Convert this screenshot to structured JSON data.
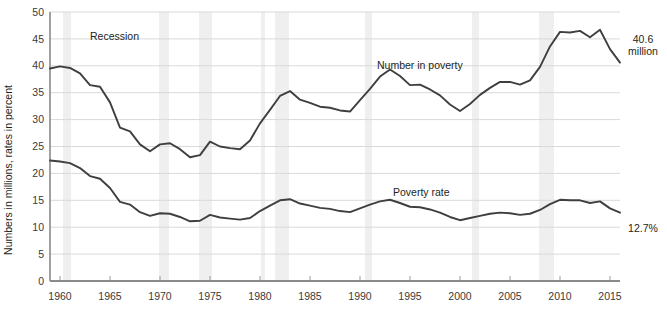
{
  "chart_data": {
    "type": "line",
    "title": "",
    "subtitle": "",
    "xlabel": "",
    "ylabel": "Numbers in millions, rates in percent",
    "xlim": [
      1959,
      2016
    ],
    "ylim": [
      0,
      50
    ],
    "grid": true,
    "legend_position": "inline-annotations",
    "yticks": [
      0,
      5,
      10,
      15,
      20,
      25,
      30,
      35,
      40,
      45,
      50
    ],
    "xticks": [
      1960,
      1965,
      1970,
      1975,
      1980,
      1985,
      1990,
      1995,
      2000,
      2005,
      2010,
      2015
    ],
    "x": [
      1959,
      1960,
      1961,
      1962,
      1963,
      1964,
      1965,
      1966,
      1967,
      1968,
      1969,
      1970,
      1971,
      1972,
      1973,
      1974,
      1975,
      1976,
      1977,
      1978,
      1979,
      1980,
      1981,
      1982,
      1983,
      1984,
      1985,
      1986,
      1987,
      1988,
      1989,
      1990,
      1991,
      1992,
      1993,
      1994,
      1995,
      1996,
      1997,
      1998,
      1999,
      2000,
      2001,
      2002,
      2003,
      2004,
      2005,
      2006,
      2007,
      2008,
      2009,
      2010,
      2011,
      2012,
      2013,
      2014,
      2015,
      2016
    ],
    "series": [
      {
        "name": "Number in poverty",
        "units": "millions",
        "annotation": "Number in poverty",
        "end_label": "40.6\nmillion",
        "end_label_line1": "40.6",
        "end_label_line2": "million",
        "values": [
          39.5,
          39.9,
          39.6,
          38.6,
          36.4,
          36.1,
          33.2,
          28.5,
          27.8,
          25.4,
          24.1,
          25.4,
          25.6,
          24.5,
          23.0,
          23.4,
          25.9,
          25.0,
          24.7,
          24.5,
          26.1,
          29.3,
          31.8,
          34.4,
          35.3,
          33.7,
          33.1,
          32.4,
          32.2,
          31.7,
          31.5,
          33.6,
          35.7,
          38.0,
          39.3,
          38.1,
          36.4,
          36.5,
          35.6,
          34.5,
          32.8,
          31.6,
          32.9,
          34.6,
          35.9,
          37.0,
          37.0,
          36.5,
          37.3,
          39.8,
          43.6,
          46.3,
          46.2,
          46.5,
          45.3,
          46.7,
          43.1,
          40.6
        ]
      },
      {
        "name": "Poverty rate",
        "units": "percent",
        "annotation": "Poverty rate",
        "end_label": "12.7%",
        "end_label_line1": "12.7%",
        "values": [
          22.4,
          22.2,
          21.9,
          21.0,
          19.5,
          19.0,
          17.3,
          14.7,
          14.2,
          12.8,
          12.1,
          12.6,
          12.5,
          11.9,
          11.1,
          11.2,
          12.3,
          11.8,
          11.6,
          11.4,
          11.7,
          13.0,
          14.0,
          15.0,
          15.2,
          14.4,
          14.0,
          13.6,
          13.4,
          13.0,
          12.8,
          13.5,
          14.2,
          14.8,
          15.1,
          14.5,
          13.8,
          13.7,
          13.3,
          12.7,
          11.9,
          11.3,
          11.7,
          12.1,
          12.5,
          12.7,
          12.6,
          12.3,
          12.5,
          13.2,
          14.3,
          15.1,
          15.0,
          15.0,
          14.5,
          14.8,
          13.5,
          12.7
        ]
      }
    ],
    "recessions": [
      {
        "start": 1960.3,
        "end": 1961.1
      },
      {
        "start": 1969.9,
        "end": 1970.9
      },
      {
        "start": 1973.9,
        "end": 1975.2
      },
      {
        "start": 1980.1,
        "end": 1980.5
      },
      {
        "start": 1981.5,
        "end": 1982.9
      },
      {
        "start": 1990.5,
        "end": 1991.2
      },
      {
        "start": 2001.2,
        "end": 2001.9
      },
      {
        "start": 2007.9,
        "end": 2009.4
      }
    ],
    "recession_label": "Recession"
  },
  "annotations": {
    "recession": "Recession",
    "number_in_poverty": "Number in poverty",
    "poverty_rate": "Poverty rate",
    "end_number_line1": "40.6",
    "end_number_line2": "million",
    "end_rate": "12.7%"
  },
  "axis": {
    "ylabel": "Numbers in millions, rates in percent",
    "yticks": [
      "0",
      "5",
      "10",
      "15",
      "20",
      "25",
      "30",
      "35",
      "40",
      "45",
      "50"
    ],
    "xticks": [
      "1960",
      "1965",
      "1970",
      "1975",
      "1980",
      "1985",
      "1990",
      "1995",
      "2000",
      "2005",
      "2010",
      "2015"
    ]
  },
  "colors": {
    "line": "#3f3f3f",
    "grid": "#d9d9d9",
    "axis": "#8a8a8a",
    "recession_band": "#efefef",
    "text": "#231f20",
    "background": "#ffffff"
  }
}
